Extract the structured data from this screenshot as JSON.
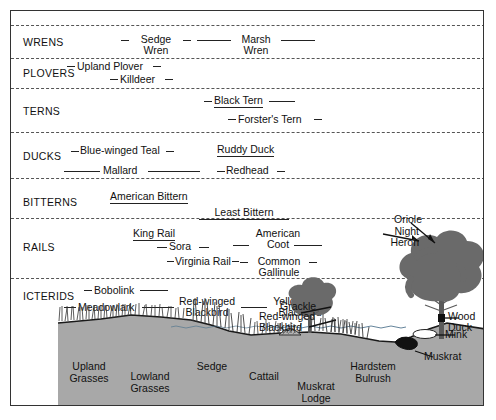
{
  "diagram": {
    "background": "#ffffff",
    "soil_color": "#a8a8a8",
    "line_color": "#222222",
    "divider_style": "dashed"
  },
  "groups": [
    {
      "label": "WRENS",
      "top": 25,
      "bottom": 58
    },
    {
      "label": "PLOVERS",
      "top": 58,
      "bottom": 88
    },
    {
      "label": "TERNS",
      "top": 88,
      "bottom": 132
    },
    {
      "label": "DUCKS",
      "top": 132,
      "bottom": 178
    },
    {
      "label": "BITTERNS",
      "top": 178,
      "bottom": 218
    },
    {
      "label": "RAILS",
      "top": 218,
      "bottom": 278
    },
    {
      "label": "ICTERIDS",
      "top": 278,
      "bottom": 318
    }
  ],
  "species": [
    {
      "name": "Sedge Wren",
      "lines": [
        "Sedge",
        "Wren"
      ],
      "group": "WRENS"
    },
    {
      "name": "Marsh Wren",
      "lines": [
        "Marsh",
        "Wren"
      ],
      "group": "WRENS"
    },
    {
      "name": "Upland Plover",
      "lines": [
        "Upland Plover"
      ],
      "group": "PLOVERS"
    },
    {
      "name": "Killdeer",
      "lines": [
        "Killdeer"
      ],
      "group": "PLOVERS"
    },
    {
      "name": "Black Tern",
      "lines": [
        "Black Tern"
      ],
      "group": "TERNS"
    },
    {
      "name": "Forster's Tern",
      "lines": [
        "Forster's Tern"
      ],
      "group": "TERNS"
    },
    {
      "name": "Blue-winged Teal",
      "lines": [
        "Blue-winged Teal"
      ],
      "group": "DUCKS"
    },
    {
      "name": "Ruddy Duck",
      "lines": [
        "Ruddy Duck"
      ],
      "group": "DUCKS"
    },
    {
      "name": "Mallard",
      "lines": [
        "Mallard"
      ],
      "group": "DUCKS"
    },
    {
      "name": "Redhead",
      "lines": [
        "Redhead"
      ],
      "group": "DUCKS"
    },
    {
      "name": "American Bittern",
      "lines": [
        "American Bittern"
      ],
      "group": "BITTERNS"
    },
    {
      "name": "Least Bittern",
      "lines": [
        "Least Bittern"
      ],
      "group": "BITTERNS"
    },
    {
      "name": "King Rail",
      "lines": [
        "King Rail"
      ],
      "group": "RAILS"
    },
    {
      "name": "American Coot",
      "lines": [
        "American",
        "Coot"
      ],
      "group": "RAILS"
    },
    {
      "name": "Sora",
      "lines": [
        "Sora"
      ],
      "group": "RAILS"
    },
    {
      "name": "Virginia Rail",
      "lines": [
        "Virginia Rail"
      ],
      "group": "RAILS"
    },
    {
      "name": "Common Gallinule",
      "lines": [
        "Common",
        "Gallinule"
      ],
      "group": "RAILS"
    },
    {
      "name": "Bobolink",
      "lines": [
        "Bobolink"
      ],
      "group": "ICTERIDS"
    },
    {
      "name": "Meadowlark",
      "lines": [
        "Meadowlark"
      ],
      "group": "ICTERIDS"
    },
    {
      "name": "Red-winged Blackbird (left)",
      "lines": [
        "Red-winged",
        "Blackbird"
      ],
      "group": "ICTERIDS"
    },
    {
      "name": "Yellowhead Blackbird",
      "lines": [
        "Yellowhead",
        "Blackbird"
      ],
      "group": "ICTERIDS"
    }
  ],
  "labels": {
    "sedge_wren_1": "Sedge",
    "sedge_wren_2": "Wren",
    "marsh_wren_1": "Marsh",
    "marsh_wren_2": "Wren",
    "upland_plover": "Upland Plover",
    "killdeer": "Killdeer",
    "black_tern": "Black Tern",
    "forsters_tern": "Forster's Tern",
    "blue_winged_teal": "Blue-winged Teal",
    "ruddy_duck": "Ruddy Duck",
    "mallard": "Mallard",
    "redhead": "Redhead",
    "american_bittern": "American Bittern",
    "least_bittern": "Least Bittern",
    "king_rail": "King Rail",
    "american_coot_1": "American",
    "american_coot_2": "Coot",
    "sora": "Sora",
    "virginia_rail": "Virginia Rail",
    "common_gallinule_1": "Common",
    "common_gallinule_2": "Gallinule",
    "bobolink": "Bobolink",
    "meadowlark": "Meadowlark",
    "redwinged_l1": "Red-winged",
    "redwinged_l2": "Blackbird",
    "yellowhead_l1": "Yellowhead",
    "yellowhead_l2": "Blackbird",
    "oriole": "Oriole",
    "night_heron_1": "Night",
    "night_heron_2": "Heron",
    "grackle": "Grackle",
    "rw_right_1": "Red-winged",
    "rw_right_2": "Blackbird",
    "wood_duck_1": "Wood",
    "wood_duck_2": "Duck",
    "mink": "Mink",
    "muskrat": "Muskrat"
  },
  "vegetation": [
    {
      "name": "Upland Grasses",
      "lines": [
        "Upland",
        "Grasses"
      ]
    },
    {
      "name": "Lowland Grasses",
      "lines": [
        "Lowland",
        "Grasses"
      ]
    },
    {
      "name": "Sedge",
      "lines": [
        "Sedge"
      ]
    },
    {
      "name": "Cattail",
      "lines": [
        "Cattail"
      ]
    },
    {
      "name": "Muskrat Lodge",
      "lines": [
        "Muskrat",
        "Lodge"
      ]
    },
    {
      "name": "Hardstem Bulrush",
      "lines": [
        "Hardstem",
        "Bulrush"
      ]
    }
  ],
  "veg_labels": {
    "upland_1": "Upland",
    "upland_2": "Grasses",
    "lowland_1": "Lowland",
    "lowland_2": "Grasses",
    "sedge": "Sedge",
    "cattail": "Cattail",
    "muskrat_lodge_1": "Muskrat",
    "muskrat_lodge_2": "Lodge",
    "hardstem_1": "Hardstem",
    "hardstem_2": "Bulrush"
  },
  "group_labels": {
    "wrens": "WRENS",
    "plovers": "PLOVERS",
    "terns": "TERNS",
    "ducks": "DUCKS",
    "bitterns": "BITTERNS",
    "rails": "RAILS",
    "icterids": "ICTERIDS"
  }
}
